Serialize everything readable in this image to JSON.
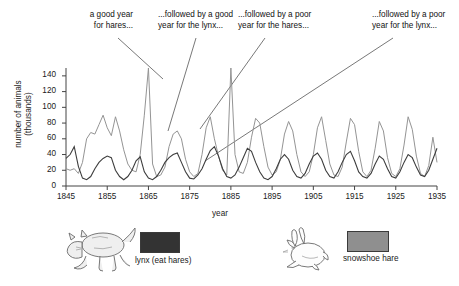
{
  "chart_data": {
    "type": "line",
    "title": "",
    "xlabel": "year",
    "ylabel": "number of animals\n(thousands)",
    "xlim": [
      1845,
      1935
    ],
    "ylim": [
      0,
      150
    ],
    "grid": false,
    "legend_position": "below-plot",
    "xticks": [
      "1845",
      "1855",
      "1865",
      "1875",
      "1885",
      "1895",
      "1905",
      "1915",
      "1925",
      "1935"
    ],
    "yticks": [
      "0",
      "20",
      "40",
      "60",
      "80",
      "100",
      "120",
      "140"
    ],
    "x": [
      1845,
      1846,
      1847,
      1848,
      1849,
      1850,
      1851,
      1852,
      1853,
      1854,
      1855,
      1856,
      1857,
      1858,
      1859,
      1860,
      1861,
      1862,
      1863,
      1864,
      1865,
      1866,
      1867,
      1868,
      1869,
      1870,
      1871,
      1872,
      1873,
      1874,
      1875,
      1876,
      1877,
      1878,
      1879,
      1880,
      1881,
      1882,
      1883,
      1884,
      1885,
      1886,
      1887,
      1888,
      1889,
      1890,
      1891,
      1892,
      1893,
      1894,
      1895,
      1896,
      1897,
      1898,
      1899,
      1900,
      1901,
      1902,
      1903,
      1904,
      1905,
      1906,
      1907,
      1908,
      1909,
      1910,
      1911,
      1912,
      1913,
      1914,
      1915,
      1916,
      1917,
      1918,
      1919,
      1920,
      1921,
      1922,
      1923,
      1924,
      1925,
      1926,
      1927,
      1928,
      1929,
      1930,
      1931,
      1932,
      1933,
      1934,
      1935
    ],
    "series": [
      {
        "name": "lynx (eat hares)",
        "color": "#3d3d3d",
        "values": [
          35,
          40,
          50,
          25,
          10,
          8,
          12,
          22,
          30,
          35,
          38,
          36,
          20,
          12,
          8,
          12,
          20,
          32,
          37,
          18,
          10,
          8,
          12,
          20,
          30,
          36,
          40,
          42,
          30,
          18,
          10,
          9,
          14,
          22,
          34,
          45,
          50,
          38,
          22,
          12,
          10,
          14,
          24,
          36,
          48,
          44,
          30,
          18,
          10,
          8,
          12,
          22,
          34,
          40,
          34,
          20,
          12,
          10,
          16,
          28,
          38,
          42,
          34,
          20,
          12,
          10,
          18,
          30,
          40,
          44,
          32,
          18,
          12,
          10,
          16,
          28,
          38,
          34,
          22,
          12,
          10,
          18,
          30,
          40,
          36,
          24,
          14,
          12,
          20,
          34,
          48
        ]
      },
      {
        "name": "snowshoe hare",
        "color": "#949494",
        "values": [
          22,
          20,
          22,
          16,
          30,
          60,
          68,
          66,
          78,
          90,
          74,
          64,
          88,
          70,
          46,
          28,
          20,
          18,
          40,
          90,
          150,
          28,
          12,
          14,
          24,
          50,
          66,
          70,
          60,
          34,
          18,
          12,
          16,
          40,
          74,
          88,
          60,
          38,
          20,
          14,
          150,
          40,
          18,
          16,
          30,
          62,
          86,
          80,
          50,
          24,
          14,
          18,
          34,
          66,
          82,
          70,
          40,
          18,
          12,
          18,
          40,
          74,
          88,
          58,
          28,
          14,
          12,
          24,
          56,
          86,
          78,
          44,
          18,
          12,
          20,
          48,
          82,
          70,
          36,
          16,
          12,
          22,
          52,
          88,
          72,
          38,
          16,
          12,
          26,
          62,
          30
        ]
      }
    ],
    "annotations": [
      {
        "text": "a good year\nfor hares...",
        "target_year": 1865,
        "target_value": 150
      },
      {
        "text": "...followed by a good\nyear for the lynx...",
        "target_year": 1869,
        "target_value": 60
      },
      {
        "text": "...followed by a poor\nyear for the hares...",
        "target_year": 1886,
        "target_value": 40
      },
      {
        "text": "...followed by a poor\nyear for the lynx...",
        "target_year": 1896,
        "target_value": 30
      }
    ]
  },
  "legend": {
    "lynx": {
      "label": "lynx (eat hares)",
      "color": "#333333"
    },
    "hare": {
      "label": "snowshoe hare",
      "color": "#8f8f8f"
    }
  },
  "icons": {
    "lynx": "lynx-illustration",
    "hare": "hare-illustration"
  }
}
